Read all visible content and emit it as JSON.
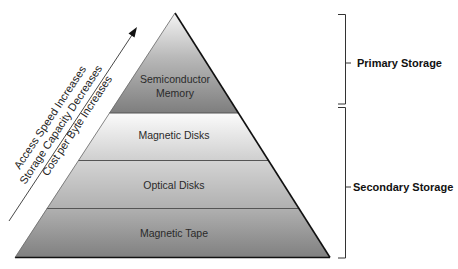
{
  "diagram": {
    "type": "memory-hierarchy-pyramid",
    "layers": [
      {
        "label_line1": "Semiconductor",
        "label_line2": "Memory",
        "group": "primary"
      },
      {
        "label": "Magnetic Disks",
        "group": "secondary"
      },
      {
        "label": "Optical Disks",
        "group": "secondary"
      },
      {
        "label": "Magnetic Tape",
        "group": "secondary"
      }
    ],
    "brackets": {
      "primary": "Primary Storage",
      "secondary": "Secondary Storage"
    },
    "arrow_labels": [
      "Access Speed Increases",
      "Storage Capacity Decreases",
      "Cost per Byte Increases"
    ],
    "colors": {
      "top_layer": "#8a8a8a",
      "top_layer_light": "#d8d8d8",
      "layer_light": "#f2f2f2",
      "layer_mid": "#bdbdbd",
      "layer_dark": "#8f8f8f",
      "outline": "#111111"
    }
  }
}
